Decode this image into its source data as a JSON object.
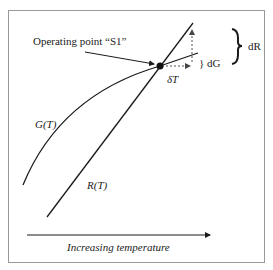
{
  "diagram": {
    "operating_point_label": "Operating point “S1”",
    "curve_g_label": "G(T)",
    "curve_r_label": "R(T)",
    "dR_label": "dR",
    "dG_label": "} dG",
    "deltaT_label": "δT",
    "axis_label": "Increasing temperature",
    "colors": {
      "line": "#1a1a1a",
      "dashed": "#555555",
      "border": "#999999"
    }
  }
}
